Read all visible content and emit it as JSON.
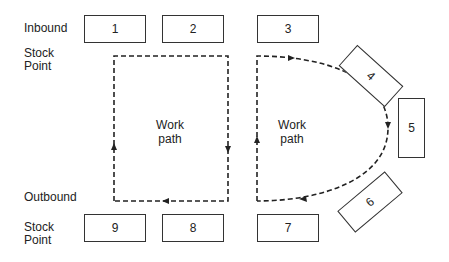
{
  "diagram": {
    "labels": {
      "inbound": "Inbound",
      "inbound_stock": "Stock",
      "inbound_point": "Point",
      "outbound": "Outbound",
      "outbound_stock": "Stock",
      "outbound_point": "Point"
    },
    "work_path_left": {
      "line1": "Work",
      "line2": "path"
    },
    "work_path_right": {
      "line1": "Work",
      "line2": "path"
    },
    "stations": [
      {
        "id": "1"
      },
      {
        "id": "2"
      },
      {
        "id": "3"
      },
      {
        "id": "4"
      },
      {
        "id": "5"
      },
      {
        "id": "6"
      },
      {
        "id": "7"
      },
      {
        "id": "8"
      },
      {
        "id": "9"
      }
    ]
  }
}
